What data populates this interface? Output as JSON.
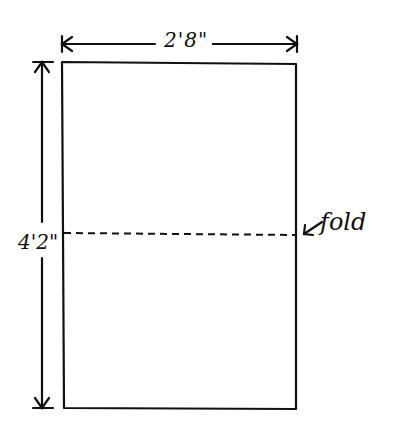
{
  "diagram": {
    "type": "dimensioned sheet with fold line",
    "width_dimension": "2'8\"",
    "height_dimension": "4'2\"",
    "fold_label": "fold",
    "colors": {
      "ink": "#111111",
      "background": "#ffffff"
    }
  }
}
